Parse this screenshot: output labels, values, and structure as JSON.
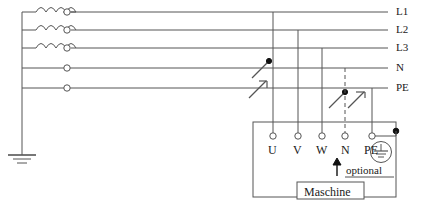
{
  "diagram": {
    "line_color": "#555555",
    "text_color": "#1a1a1a",
    "bus_labels": [
      {
        "id": "l1",
        "text": "L1"
      },
      {
        "id": "l2",
        "text": "L2"
      },
      {
        "id": "l3",
        "text": "L3"
      },
      {
        "id": "n",
        "text": "N"
      },
      {
        "id": "pe",
        "text": "PE"
      }
    ],
    "terminals": [
      {
        "id": "u",
        "text": "U"
      },
      {
        "id": "v",
        "text": "V"
      },
      {
        "id": "w",
        "text": "W"
      },
      {
        "id": "n",
        "text": "N"
      },
      {
        "id": "pe",
        "text": "PE"
      }
    ],
    "annotations": {
      "optional": "optional",
      "machine": "Maschine"
    },
    "symbols": {
      "coil": "inductor-coil",
      "isolator": "isolating-terminal",
      "switch": "disconnect-switch",
      "earth": "earth-ground-symbol",
      "protective_earth": "protective-earth-symbol",
      "junction": "junction-dot",
      "arrow": "up-arrow"
    }
  }
}
